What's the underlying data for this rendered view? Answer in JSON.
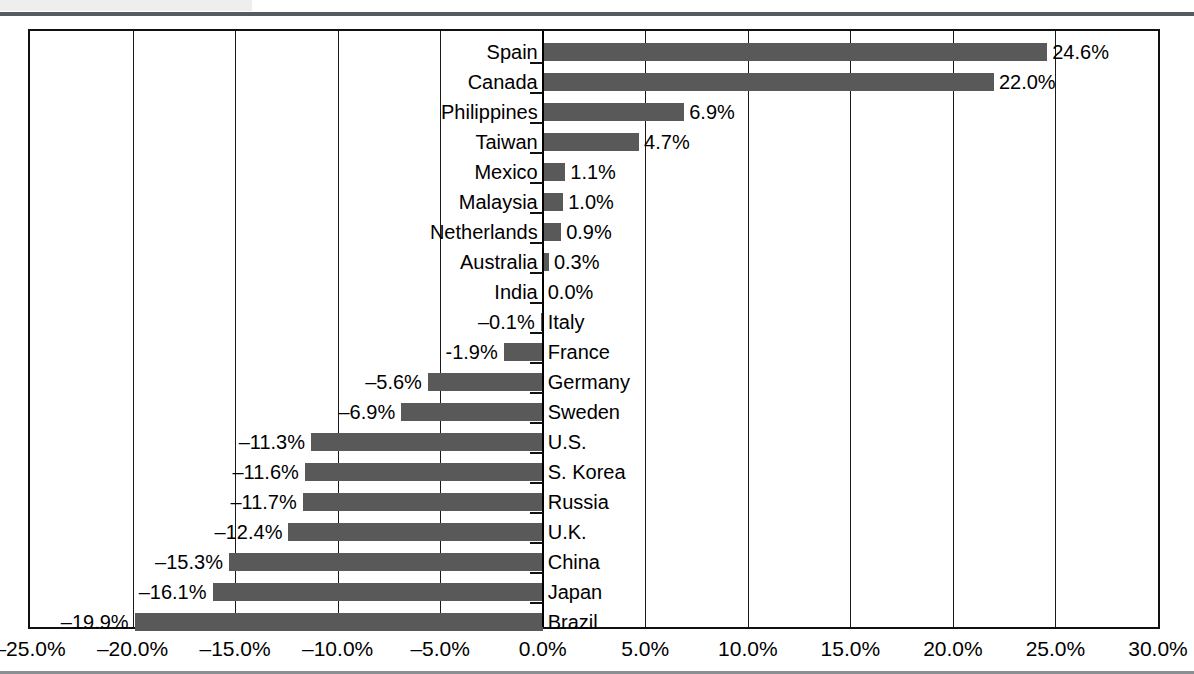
{
  "header": {
    "block_label": "",
    "rule_color": "#555b5e"
  },
  "chart_data": {
    "type": "bar",
    "orientation": "horizontal",
    "title": "",
    "subtitle": "",
    "xlabel": "",
    "ylabel": "",
    "grid": true,
    "legend": false,
    "xlim": [
      -25.0,
      30.0
    ],
    "xticks": [
      -25.0,
      -20.0,
      -15.0,
      -10.0,
      -5.0,
      0.0,
      5.0,
      10.0,
      15.0,
      20.0,
      25.0,
      30.0
    ],
    "xtick_labels": [
      "–25.0%",
      "–20.0%",
      "–15.0%",
      "–10.0%",
      "–5.0%",
      "0.0%",
      "5.0%",
      "10.0%",
      "15.0%",
      "20.0%",
      "25.0%",
      "30.0%"
    ],
    "bar_color": "#595959",
    "categories": [
      "Spain",
      "Canada",
      "Philippines",
      "Taiwan",
      "Mexico",
      "Malaysia",
      "Netherlands",
      "Australia",
      "India",
      "Italy",
      "France",
      "Germany",
      "Sweden",
      "U.S.",
      "S. Korea",
      "Russia",
      "U.K.",
      "China",
      "Japan",
      "Brazil"
    ],
    "values": [
      24.6,
      22.0,
      6.9,
      4.7,
      1.1,
      1.0,
      0.9,
      0.3,
      0.0,
      -0.1,
      -1.9,
      -5.6,
      -6.9,
      -11.3,
      -11.6,
      -11.7,
      -12.4,
      -15.3,
      -16.1,
      -19.9
    ],
    "data_labels": [
      "24.6%",
      "22.0%",
      "6.9%",
      "4.7%",
      "1.1%",
      "1.0%",
      "0.9%",
      "0.3%",
      "0.0%",
      "–0.1%",
      "-1.9%",
      "–5.6%",
      "–6.9%",
      "–11.3%",
      "–11.6%",
      "–11.7%",
      "–12.4%",
      "–15.3%",
      "–16.1%",
      "–19.9%"
    ]
  }
}
